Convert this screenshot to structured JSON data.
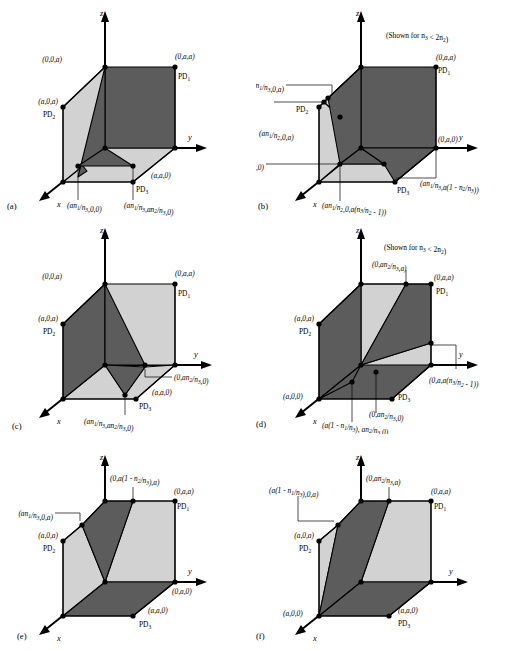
{
  "figure": {
    "panels": [
      {
        "id": "a",
        "panel_label": "(a)",
        "note": "",
        "axes": {
          "x": "x",
          "y": "y",
          "z": "z"
        },
        "labels": [
          {
            "name": "vertex-0-0-a",
            "text": "(0,0,a)"
          },
          {
            "name": "vertex-0-a-a",
            "text": "(0,a,a)"
          },
          {
            "name": "pd1",
            "text": "PD",
            "sub": "1"
          },
          {
            "name": "vertex-a-0-a",
            "text": "(a,0,a)"
          },
          {
            "name": "pd2",
            "text": "PD",
            "sub": "2"
          },
          {
            "name": "vertex-a-a-0",
            "text": "(a,a,0)"
          },
          {
            "name": "pd3",
            "text": "PD",
            "sub": "3"
          },
          {
            "name": "vertex-an1n3-0-0",
            "text": "(an1/n3,0,0)"
          },
          {
            "name": "vertex-an1n3-an2n3-0",
            "text": "(an1/n3,an2/n3,0)"
          }
        ]
      },
      {
        "id": "b",
        "panel_label": "(b)",
        "note": "(Shown for n3 < 2n2)",
        "axes": {
          "x": "x",
          "y": "y",
          "z": "z"
        },
        "labels": [
          {
            "name": "vertex-an1n3-0-a",
            "text": "(an1/n3,0,a)"
          },
          {
            "name": "vertex-0-a-a",
            "text": "(0,a,a)"
          },
          {
            "name": "pd1",
            "text": "PD",
            "sub": "1"
          },
          {
            "name": "pd2",
            "text": "PD",
            "sub": "2"
          },
          {
            "name": "vertex-an1n2-0-a",
            "text": "(an1/n2,0,a)"
          },
          {
            "name": "vertex-0-a-0",
            "text": "(0,a,0)"
          },
          {
            "name": "vertex-an1n3-0-0",
            "text": "(an1/n3,0,0)"
          },
          {
            "name": "vertex-an1n3-a-term",
            "text": "(an1/n3,a(1 - n2/n3))"
          },
          {
            "name": "pd3",
            "text": "PD",
            "sub": "3"
          },
          {
            "name": "vertex-an1n2-0-a-term",
            "text": "(an1/n2,0,a(n3/n2 - 1))"
          }
        ]
      },
      {
        "id": "c",
        "panel_label": "(c)",
        "note": "",
        "axes": {
          "x": "x",
          "y": "y",
          "z": "z"
        },
        "labels": [
          {
            "name": "vertex-0-0-a",
            "text": "(0,0,a)"
          },
          {
            "name": "vertex-0-a-a",
            "text": "(0,a,a)"
          },
          {
            "name": "pd1",
            "text": "PD",
            "sub": "1"
          },
          {
            "name": "vertex-a-0-a",
            "text": "(a,0,a)"
          },
          {
            "name": "pd2",
            "text": "PD",
            "sub": "2"
          },
          {
            "name": "vertex-0-an2n3-0",
            "text": "(0,an2/n3,0)"
          },
          {
            "name": "vertex-a-a-0",
            "text": "(a,a,0)"
          },
          {
            "name": "pd3",
            "text": "PD",
            "sub": "3"
          },
          {
            "name": "vertex-an1n3-an2n3-0",
            "text": "(an1/n3,an2/n3,0)"
          }
        ]
      },
      {
        "id": "d",
        "panel_label": "(d)",
        "note": "(Shown for n3 < 2n2)",
        "axes": {
          "x": "x",
          "y": "y",
          "z": "z"
        },
        "labels": [
          {
            "name": "vertex-0-an2n3-a",
            "text": "(0,an2/n3,a)"
          },
          {
            "name": "vertex-0-a-a",
            "text": "(0,a,a)"
          },
          {
            "name": "pd1",
            "text": "PD",
            "sub": "1"
          },
          {
            "name": "vertex-a-0-a",
            "text": "(a,0,a)"
          },
          {
            "name": "pd2",
            "text": "PD",
            "sub": "2"
          },
          {
            "name": "vertex-0-a-a-term",
            "text": "(0,a,a(n3/n2 - 1))"
          },
          {
            "name": "vertex-a-0-0",
            "text": "(a,0,0)"
          },
          {
            "name": "vertex-0-an2n3-0",
            "text": "(0,an2/n3,0)"
          },
          {
            "name": "pd3",
            "text": "PD",
            "sub": "3"
          },
          {
            "name": "vertex-a-term-an2n3-0",
            "text": "(a(1 - n1/n3), an2/n3,0)"
          }
        ]
      },
      {
        "id": "e",
        "panel_label": "(e)",
        "note": "",
        "axes": {
          "x": "x",
          "y": "y",
          "z": "z"
        },
        "labels": [
          {
            "name": "vertex-0-a-term-a",
            "text": "(0,a(1 - n2/n3),a)"
          },
          {
            "name": "vertex-0-a-a",
            "text": "(0,a,a)"
          },
          {
            "name": "pd1",
            "text": "PD",
            "sub": "1"
          },
          {
            "name": "vertex-an1n3-0-a",
            "text": "(an1/n3,0,a)"
          },
          {
            "name": "vertex-a-0-a",
            "text": "(a,0,a)"
          },
          {
            "name": "pd2",
            "text": "PD",
            "sub": "2"
          },
          {
            "name": "vertex-0-a-0",
            "text": "(0,a,0)"
          },
          {
            "name": "vertex-a-a-0",
            "text": "(a,a,0)"
          },
          {
            "name": "pd3",
            "text": "PD",
            "sub": "3"
          }
        ]
      },
      {
        "id": "f",
        "panel_label": "(f)",
        "note": "",
        "axes": {
          "x": "x",
          "y": "y",
          "z": "z"
        },
        "labels": [
          {
            "name": "vertex-0-an2n3-a",
            "text": "(0,an2/n3,a)"
          },
          {
            "name": "vertex-0-a-a",
            "text": "(0,a,a)"
          },
          {
            "name": "pd1",
            "text": "PD",
            "sub": "1"
          },
          {
            "name": "vertex-a-term-0-a",
            "text": "(a(1 - n1/n3),0,a)"
          },
          {
            "name": "vertex-a-0-a",
            "text": "(a,0,a)"
          },
          {
            "name": "pd2",
            "text": "PD",
            "sub": "2"
          },
          {
            "name": "vertex-a-0-0",
            "text": "(a,0,0)"
          },
          {
            "name": "vertex-a-a-0",
            "text": "(a,a,0)"
          },
          {
            "name": "pd3",
            "text": "PD",
            "sub": "3"
          }
        ]
      }
    ],
    "colors": {
      "dark_face": "#5c5c5c",
      "light_face": "#d2d2d2",
      "stroke": "#000000",
      "background": "#ffffff"
    }
  }
}
